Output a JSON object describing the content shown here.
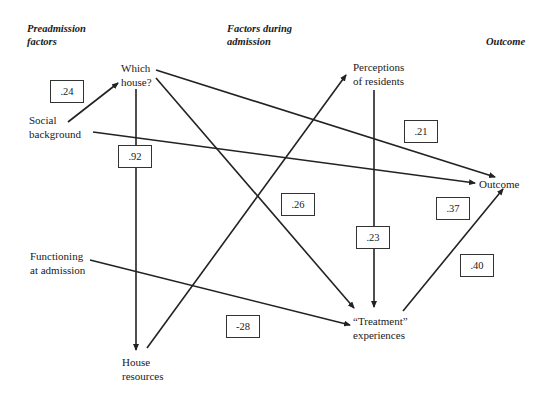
{
  "headers": {
    "preadmission": "Preadmission factors",
    "preadmission_line1": "Preadmission",
    "preadmission_line2": "factors",
    "during": "Factors during admission",
    "during_line1": "Factors during",
    "during_line2": "admission",
    "outcome": "Outcome"
  },
  "nodes": {
    "which_house": {
      "line1": "Which",
      "line2": "house?"
    },
    "social_background": {
      "line1": "Social",
      "line2": "background"
    },
    "functioning": {
      "line1": "Functioning",
      "line2": "at admission"
    },
    "house_resources": {
      "line1": "House",
      "line2": "resources"
    },
    "perceptions": {
      "line1": "Perceptions",
      "line2": "of residents"
    },
    "treatment": {
      "line1": "“Treatment”",
      "line2": "experiences"
    },
    "outcome": {
      "line1": "Outcome"
    }
  },
  "coefficients": {
    "social_to_house": ".24",
    "house_to_resources": ".92",
    "house_to_outcome": ".21",
    "house_to_treatment": ".26",
    "perceptions_to_treatment": ".23",
    "social_to_outcome": ".37",
    "treatment_to_outcome": ".40",
    "functioning_to_treatment": "-28"
  },
  "edges": [
    {
      "from": "Social background",
      "to": "Which house?",
      "coef": ".24"
    },
    {
      "from": "Which house?",
      "to": "House resources",
      "coef": ".92"
    },
    {
      "from": "Which house?",
      "to": "Outcome",
      "coef": ".21"
    },
    {
      "from": "Which house?",
      "to": "Treatment experiences",
      "coef": ".26"
    },
    {
      "from": "Social background",
      "to": "Outcome",
      "coef": ".37"
    },
    {
      "from": "House resources",
      "to": "Perceptions of residents",
      "coef": ""
    },
    {
      "from": "Perceptions of residents",
      "to": "Treatment experiences",
      "coef": ".23"
    },
    {
      "from": "Functioning at admission",
      "to": "Treatment experiences",
      "coef": "-28"
    },
    {
      "from": "Treatment experiences",
      "to": "Outcome",
      "coef": ".40"
    }
  ],
  "colors": {
    "line": "#222222",
    "text": "#1a1a1a",
    "background": "#ffffff"
  }
}
